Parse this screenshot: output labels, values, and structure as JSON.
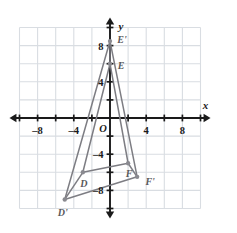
{
  "figure": {
    "kind": "coordinate-plane-geometry",
    "background": "#ffffff",
    "grid_color": "#d9dde2",
    "axis_color": "#1a1a1a",
    "shape_color": "#7d7d83",
    "vertex_color": "#8a8a90",
    "label_color": "#59595b"
  },
  "axes": {
    "x_axis_label": "x",
    "y_axis_label": "y",
    "origin_label": "O",
    "x_ticks": [
      {
        "value": -8,
        "label": "–8"
      },
      {
        "value": -4,
        "label": "–4"
      },
      {
        "value": 4,
        "label": "4"
      },
      {
        "value": 8,
        "label": "8"
      }
    ],
    "y_ticks": [
      {
        "value": 8,
        "label": "8"
      },
      {
        "value": 4,
        "label": "4"
      },
      {
        "value": -4,
        "label": "–4"
      },
      {
        "value": -8,
        "label": "–8"
      }
    ],
    "x_range": [
      -11,
      11
    ],
    "y_range": [
      -11,
      11
    ],
    "grid_step": 2,
    "grid_x_range": [
      -10,
      10
    ],
    "grid_y_range": [
      -10,
      10
    ]
  },
  "chart_data": {
    "type": "scatter",
    "title": "",
    "xlabel": "x",
    "ylabel": "y",
    "xlim": [
      -11,
      11
    ],
    "ylim": [
      -11,
      11
    ],
    "grid": true,
    "series": [
      {
        "name": "Triangle DEF",
        "closed": true,
        "points": [
          {
            "label": "D",
            "x": -3,
            "y": -6
          },
          {
            "label": "E",
            "x": 0,
            "y": 6
          },
          {
            "label": "F",
            "x": 2,
            "y": -5
          }
        ]
      },
      {
        "name": "Triangle D'E'F'",
        "closed": true,
        "points": [
          {
            "label": "D'",
            "x": -5,
            "y": -9
          },
          {
            "label": "E'",
            "x": 0,
            "y": 8.5
          },
          {
            "label": "F'",
            "x": 3,
            "y": -6.5
          }
        ]
      }
    ],
    "connectors": [
      {
        "from": "D",
        "to": "D'"
      },
      {
        "from": "E",
        "to": "E'"
      },
      {
        "from": "F",
        "to": "F'"
      }
    ],
    "point_labels": [
      "D",
      "E",
      "F",
      "D'",
      "E'",
      "F'"
    ]
  }
}
